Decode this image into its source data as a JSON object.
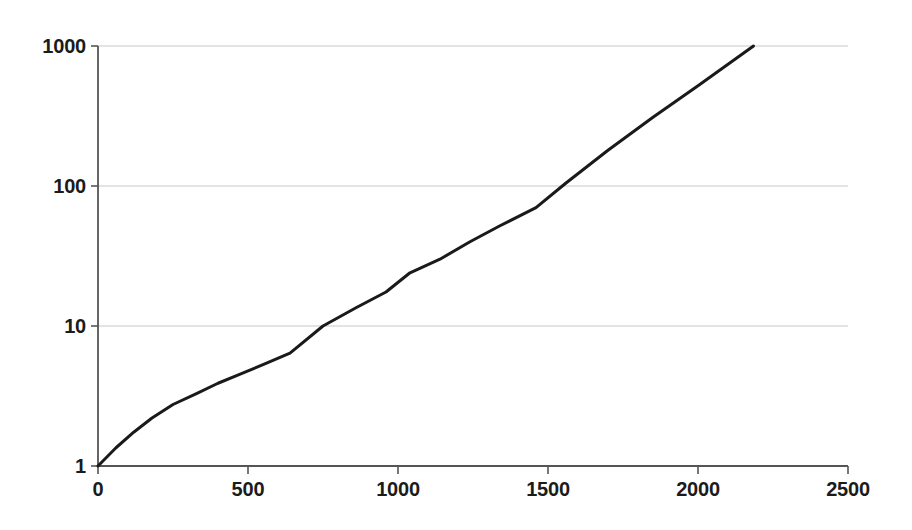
{
  "chart_data": {
    "type": "line",
    "title": "",
    "subtitle": "",
    "xlabel": "",
    "ylabel": "",
    "xlim": [
      0,
      2500
    ],
    "ylim": [
      1,
      1000
    ],
    "yscale": "log",
    "xscale": "linear",
    "grid": "horizontal-only",
    "legend": null,
    "annotations": [],
    "x_ticks": [
      {
        "value": 0,
        "label": "0"
      },
      {
        "value": 500,
        "label": "500"
      },
      {
        "value": 1000,
        "label": "1000"
      },
      {
        "value": 1500,
        "label": "1500"
      },
      {
        "value": 2000,
        "label": "2000"
      },
      {
        "value": 2500,
        "label": "2500"
      }
    ],
    "y_ticks": [
      {
        "value": 1,
        "label": "1"
      },
      {
        "value": 10,
        "label": "10"
      },
      {
        "value": 100,
        "label": "100"
      },
      {
        "value": 1000,
        "label": "1000"
      }
    ],
    "series": [
      {
        "name": "curve",
        "color": "#1a1a1a",
        "line_width": 3,
        "x": [
          0,
          60,
          120,
          180,
          250,
          330,
          400,
          470,
          550,
          640,
          750,
          860,
          960,
          1040,
          1140,
          1240,
          1340,
          1460,
          1560,
          1700,
          1850,
          2000,
          2185
        ],
        "y": [
          1.0,
          1.35,
          1.75,
          2.2,
          2.75,
          3.3,
          3.9,
          4.5,
          5.3,
          6.4,
          10.0,
          13.5,
          17.5,
          24.0,
          30.0,
          40.0,
          52.0,
          70.0,
          105.0,
          180.0,
          310.0,
          520.0,
          1000.0
        ]
      }
    ]
  },
  "axes_geometry": {
    "plot_left_px": 98,
    "plot_bottom_px": 466,
    "x_px_per_unit": 0.3,
    "decade_height_px": 140,
    "grid_right_px": 848,
    "axis_color": "#555555",
    "grid_color": "#c8c8c8",
    "tick_text_color": "#1b1b1b"
  }
}
